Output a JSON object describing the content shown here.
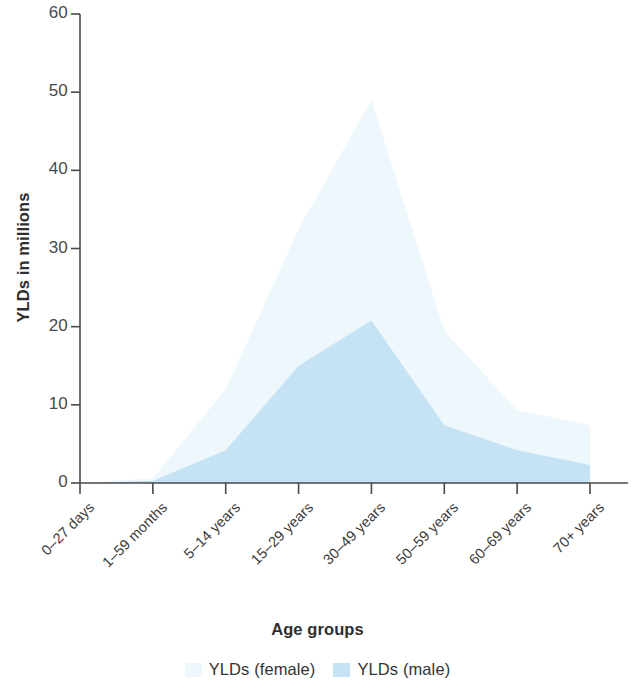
{
  "chart_data": {
    "type": "area",
    "title": "",
    "xlabel": "Age groups",
    "ylabel": "YLDs in millions",
    "categories": [
      "0–27 days",
      "1–59 months",
      "5–14 years",
      "15–29 years",
      "30–49 years",
      "50–59 years",
      "60–69 years",
      "70+ years"
    ],
    "series": [
      {
        "name": "YLDs (female)",
        "color": "#eef7fc",
        "values": [
          0,
          0.6,
          12.0,
          32.5,
          49.0,
          19.5,
          9.3,
          7.4
        ]
      },
      {
        "name": "YLDs (male)",
        "color": "#c5e3f5",
        "values": [
          0,
          0.3,
          4.2,
          15.0,
          20.8,
          7.4,
          4.2,
          2.3
        ]
      }
    ],
    "ylim": [
      0,
      60
    ],
    "yticks": [
      0,
      10,
      20,
      30,
      40,
      50,
      60
    ],
    "ytick_labels": [
      "0",
      "10",
      "20",
      "30",
      "40",
      "50",
      "60"
    ],
    "grid": false,
    "legend_position": "bottom",
    "stacking": "overlaid",
    "axis_color": "#4a4a4a",
    "background": "#ffffff"
  }
}
